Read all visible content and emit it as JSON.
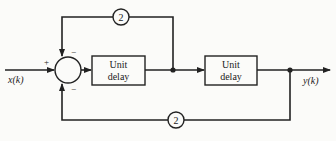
{
  "diagram": {
    "type": "block-diagram",
    "input_label": "x(k)",
    "output_label": "y(k)",
    "summing_junction": {
      "signs": {
        "input": "+",
        "top_feedback": "−",
        "bottom_feedback": "−"
      }
    },
    "blocks": [
      {
        "id": "delay1",
        "line1": "Unit",
        "line2": "delay"
      },
      {
        "id": "delay2",
        "line1": "Unit",
        "line2": "delay"
      }
    ],
    "gains": [
      {
        "id": "gain-top",
        "value": "2"
      },
      {
        "id": "gain-bottom",
        "value": "2"
      }
    ]
  }
}
